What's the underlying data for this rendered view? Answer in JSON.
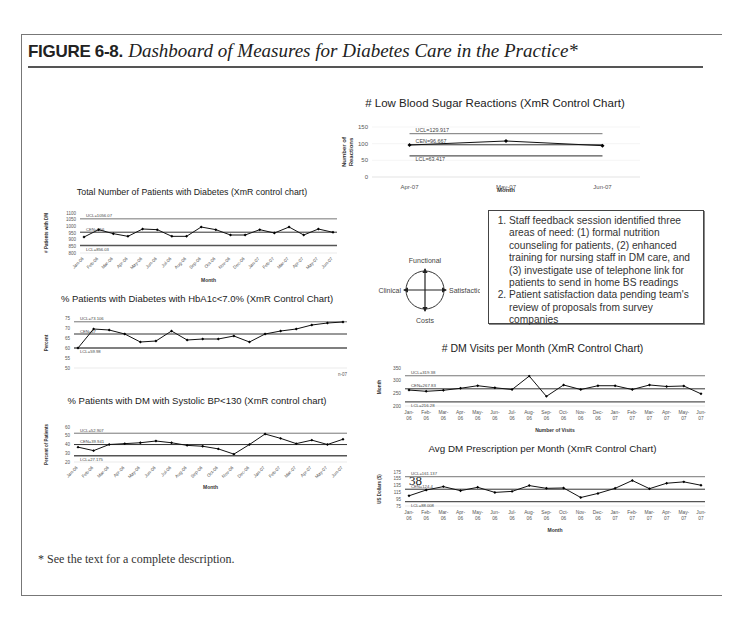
{
  "figure": {
    "number": "FIGURE 6-8.",
    "caption": "Dashboard of Measures for Diabetes Care in the Practice*",
    "footnote": "* See the text for a complete description."
  },
  "compass": {
    "top": "Functional",
    "left": "Clinical",
    "right": "Satisfaction",
    "bottom": "Costs"
  },
  "notes": [
    "Staff feedback session identified three areas of need: (1) formal nutrition counseling for patients, (2) enhanced training for nursing staff in DM care, and (3) investigate use of telephone link for patients to send in home BS readings",
    "Patient satisfaction data pending team's review of proposals from survey companies"
  ],
  "stray_label": "38",
  "chart_data": [
    {
      "id": "low_bs",
      "type": "line",
      "title": "# Low Blood Sugar Reactions (XmR Control Chart)",
      "xlabel": "Month",
      "ylabel": "Number of Reactions",
      "categories": [
        "Apr-07",
        "May-07",
        "Jun-07"
      ],
      "values": [
        96,
        108,
        94
      ],
      "ylim": [
        0,
        150
      ],
      "yticks": [
        0,
        50,
        100,
        150
      ],
      "ucl": {
        "value": 129.917,
        "label": "UCL=129.917"
      },
      "cen": {
        "value": 96.667,
        "label": "CEN=96.667"
      },
      "lcl": {
        "value": 63.417,
        "label": "LCL=63.417"
      }
    },
    {
      "id": "total_dm",
      "type": "line",
      "title": "Total Number of Patients with Diabetes (XmR control chart)",
      "xlabel": "Month",
      "ylabel": "# Patients with DM",
      "categories": [
        "Jan-06",
        "Feb-06",
        "Mar-06",
        "Apr-06",
        "May-06",
        "Jun-06",
        "Jul-06",
        "Aug-06",
        "Sep-06",
        "Oct-06",
        "Nov-06",
        "Dec-06",
        "Jan-07",
        "Feb-07",
        "Mar-07",
        "Apr-07",
        "May-07",
        "Jun-07"
      ],
      "values": [
        920,
        975,
        945,
        925,
        980,
        975,
        925,
        925,
        995,
        975,
        935,
        935,
        975,
        950,
        995,
        935,
        980,
        955
      ],
      "ylim": [
        800,
        1100
      ],
      "yticks": [
        800,
        850,
        900,
        950,
        1000,
        1050,
        1100
      ],
      "ucl": {
        "value": 1056.07,
        "label": "UCL=1056.07"
      },
      "cen": {
        "value": 956,
        "label": "CEN=956"
      },
      "lcl": {
        "value": 856.03,
        "label": "LCL=856.03"
      }
    },
    {
      "id": "hba1c",
      "type": "line",
      "title": "% Patients with Diabetes with HbA1c<7.0% (XmR Control Chart)",
      "xlabel": "",
      "ylabel": "Percent",
      "categories": [
        "Jan-06",
        "Feb-06",
        "Mar-06",
        "Apr-06",
        "May-06",
        "Jun-06",
        "Jul-06",
        "Aug-06",
        "Sep-06",
        "Oct-06",
        "Nov-06",
        "Dec-06",
        "Jan-07",
        "Feb-07",
        "Mar-07",
        "Apr-07",
        "May-07",
        "Jun-07"
      ],
      "values": [
        60,
        69.5,
        69,
        67,
        63,
        63.5,
        68.5,
        64,
        64.5,
        64.5,
        66,
        63,
        67,
        68.5,
        69.5,
        71.5,
        72.5,
        73
      ],
      "ylim": [
        50,
        75
      ],
      "yticks": [
        50,
        55,
        60,
        65,
        70,
        75
      ],
      "ucl": {
        "value": 73.106,
        "label": "UCL=73.106"
      },
      "cen": {
        "value": 67,
        "label": "CEN=67"
      },
      "lcl": {
        "value": 59.98,
        "label": "LCL=59.98"
      },
      "x_tail_label": "n-07"
    },
    {
      "id": "bp",
      "type": "line",
      "title": "% Patients with DM with Systolic BP<130 (XmR control chart)",
      "xlabel": "Month",
      "ylabel": "Percent of Patients",
      "categories": [
        "Jan-06",
        "Feb-06",
        "Mar-06",
        "Apr-06",
        "May-06",
        "Jun-06",
        "Jul-06",
        "Aug-06",
        "Sep-06",
        "Oct-06",
        "Nov-06",
        "Dec-06",
        "Jan-07",
        "Feb-07",
        "Mar-07",
        "Apr-07",
        "May-07",
        "Jun-07"
      ],
      "values": [
        37,
        33,
        40,
        41,
        42,
        44,
        42,
        39,
        38,
        35,
        29,
        40,
        52,
        47,
        41,
        45,
        40,
        46
      ],
      "ylim": [
        20,
        60
      ],
      "yticks": [
        20,
        30,
        40,
        50,
        60
      ],
      "ucl": {
        "value": 52.907,
        "label": "UCL=52.907"
      },
      "cen": {
        "value": 39.941,
        "label": "CEN=39.941"
      },
      "lcl": {
        "value": 27.175,
        "label": "LCL=27.175"
      }
    },
    {
      "id": "visits",
      "type": "line",
      "title": "# DM Visits per Month (XmR Control Chart)",
      "xlabel": "Number of Visits",
      "ylabel": "Month",
      "categories": [
        "Jan-06",
        "Feb-06",
        "Mar-06",
        "Apr-06",
        "May-06",
        "Jun-06",
        "Jul-06",
        "Aug-06",
        "Sep-06",
        "Oct-06",
        "Nov-06",
        "Dec-06",
        "Jan-07",
        "Feb-07",
        "Mar-07",
        "Apr-07",
        "May-07",
        "Jun-07"
      ],
      "values": [
        263,
        258,
        262,
        270,
        280,
        272,
        265,
        318,
        238,
        283,
        265,
        280,
        280,
        265,
        283,
        277,
        279,
        248
      ],
      "ylim": [
        200,
        350
      ],
      "yticks": [
        200,
        250,
        300,
        350
      ],
      "ucl": {
        "value": 319.38,
        "label": "UCL=319.38"
      },
      "cen": {
        "value": 267.83,
        "label": "CEN=267.83"
      },
      "lcl": {
        "value": 216.28,
        "label": "LCL=216.28"
      }
    },
    {
      "id": "rx",
      "type": "line",
      "title": "Avg DM Prescription per Month (XmR Control Chart)",
      "xlabel": "Month",
      "ylabel": "US Dollars ($)",
      "categories": [
        "Jan-06",
        "Feb-06",
        "Mar-06",
        "Apr-06",
        "May-06",
        "Jun-06",
        "Jul-06",
        "Aug-06",
        "Sep-06",
        "Oct-06",
        "Nov-06",
        "Dec-06",
        "Jan-07",
        "Feb-07",
        "Mar-07",
        "Apr-07",
        "May-07",
        "Jun-07"
      ],
      "values": [
        105,
        122,
        132,
        120,
        130,
        115,
        118,
        135,
        127,
        128,
        100,
        112,
        127,
        150,
        126,
        142,
        146,
        136
      ],
      "ylim": [
        75,
        175
      ],
      "yticks": [
        75,
        95,
        115,
        135,
        155,
        175
      ],
      "ucl": {
        "value": 161.137,
        "label": "UCL=161.137"
      },
      "cen": {
        "value": 124.4,
        "label": "CEN=124.4"
      },
      "lcl": {
        "value": 88.008,
        "label": "LCL=88.008"
      }
    }
  ]
}
